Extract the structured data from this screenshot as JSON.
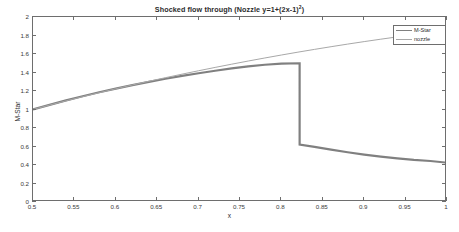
{
  "chart_data": {
    "type": "line",
    "title_main": "Shocked flow through (Nozzle y=1+(2x-1)",
    "title_sup": "2",
    "title_tail": ")",
    "xlabel": "x",
    "ylabel": "M-Star",
    "xlim": [
      0.5,
      1
    ],
    "ylim": [
      0,
      2
    ],
    "xticks": [
      "0.5",
      "0.55",
      "0.6",
      "0.65",
      "0.7",
      "0.75",
      "0.8",
      "0.85",
      "0.9",
      "0.95",
      "1"
    ],
    "xtick_values": [
      0.5,
      0.55,
      0.6,
      0.65,
      0.7,
      0.75,
      0.8,
      0.85,
      0.9,
      0.95,
      1
    ],
    "yticks": [
      "0",
      "0.2",
      "0.4",
      "0.6",
      "0.8",
      "1",
      "1.2",
      "1.4",
      "1.6",
      "1.8",
      "2"
    ],
    "ytick_values": [
      0,
      0.2,
      0.4,
      0.6,
      0.8,
      1.0,
      1.2,
      1.4,
      1.6,
      1.8,
      2.0
    ],
    "grid": false,
    "legend_position": "upper right",
    "shock_x": 0.822,
    "shock_from": 1.5,
    "shock_to": 0.62,
    "series": [
      {
        "name": "M-Star",
        "color": "#808080",
        "width": 2.2,
        "x": [
          0.5,
          0.52,
          0.54,
          0.56,
          0.58,
          0.6,
          0.62,
          0.64,
          0.66,
          0.68,
          0.7,
          0.72,
          0.74,
          0.76,
          0.78,
          0.8,
          0.822,
          0.822,
          0.84,
          0.86,
          0.88,
          0.9,
          0.92,
          0.94,
          0.96,
          0.98,
          1.0
        ],
        "y": [
          1.0,
          1.05,
          1.098,
          1.143,
          1.186,
          1.226,
          1.264,
          1.299,
          1.332,
          1.363,
          1.392,
          1.419,
          1.444,
          1.466,
          1.484,
          1.496,
          1.5,
          0.62,
          0.595,
          0.566,
          0.538,
          0.512,
          0.49,
          0.471,
          0.455,
          0.443,
          0.425
        ]
      },
      {
        "name": "nozzle",
        "color": "#a8a8a8",
        "width": 1.0,
        "x": [
          0.5,
          0.52,
          0.54,
          0.56,
          0.58,
          0.6,
          0.62,
          0.64,
          0.66,
          0.68,
          0.7,
          0.72,
          0.74,
          0.76,
          0.78,
          0.8,
          0.82,
          0.84,
          0.86,
          0.88,
          0.9,
          0.92,
          0.94,
          0.96,
          0.98,
          1.0
        ],
        "y": [
          1.0,
          1.048,
          1.094,
          1.139,
          1.182,
          1.224,
          1.265,
          1.305,
          1.344,
          1.382,
          1.419,
          1.455,
          1.49,
          1.524,
          1.557,
          1.589,
          1.62,
          1.65,
          1.679,
          1.707,
          1.734,
          1.76,
          1.785,
          1.809,
          1.832,
          1.853
        ]
      }
    ],
    "legend_entries": [
      {
        "label": "M-Star",
        "color": "#808080"
      },
      {
        "label": "nozzle",
        "color": "#a8a8a8"
      }
    ]
  },
  "axis": {
    "frame_color": "#6e6e6e"
  }
}
